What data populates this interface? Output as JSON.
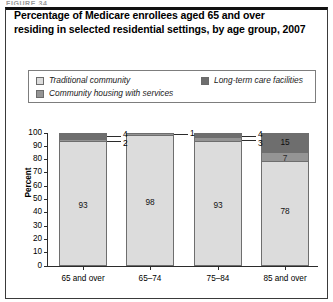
{
  "figure": {
    "stub_text": "FIGURE 34",
    "title": "Percentage of Medicare enrollees aged 65 and over residing in selected residential settings, by age group, 2007"
  },
  "legend": {
    "items": [
      {
        "label": "Traditional community",
        "color": "#dcdcdc",
        "name": "traditional-community"
      },
      {
        "label": "Community housing with services",
        "color": "#949494",
        "name": "community-housing-with-services"
      },
      {
        "label": "Long-term care facilities",
        "color": "#6e6e6e",
        "name": "long-term-care-facilities"
      }
    ]
  },
  "chart_data": {
    "type": "bar",
    "subtype": "stacked-column",
    "title": "Percentage of Medicare enrollees aged 65 and over residing in selected residential settings, by age group, 2007",
    "xlabel": "",
    "ylabel": "Percent",
    "ylim": [
      0,
      100
    ],
    "yticks": [
      0,
      10,
      20,
      30,
      40,
      50,
      60,
      70,
      80,
      90,
      100
    ],
    "grid": false,
    "legend_position": "top",
    "categories": [
      "65 and over",
      "65–74",
      "75–84",
      "85 and over"
    ],
    "series": [
      {
        "name": "Traditional community",
        "color": "#dcdcdc",
        "values": [
          93,
          98,
          93,
          78
        ]
      },
      {
        "name": "Community housing with services",
        "color": "#949494",
        "values": [
          2,
          1,
          3,
          7
        ]
      },
      {
        "name": "Long-term care facilities",
        "color": "#6e6e6e",
        "values": [
          4,
          1,
          4,
          15
        ]
      }
    ],
    "labels": {
      "65 and over": {
        "traditional": "93",
        "housing": "2",
        "ltc": "4"
      },
      "65–74": {
        "traditional": "98",
        "housing": "",
        "ltc": "1"
      },
      "75–84": {
        "traditional": "93",
        "housing": "3",
        "ltc": "4"
      },
      "85 and over": {
        "traditional": "78",
        "housing": "7",
        "ltc": "15"
      }
    },
    "callouts": [
      {
        "group": "65 and over",
        "label": "4",
        "series": "Long-term care facilities"
      },
      {
        "group": "65 and over",
        "label": "2",
        "series": "Community housing with services"
      },
      {
        "group": "65–74",
        "label": "1",
        "series": "Long-term care facilities"
      },
      {
        "group": "75–84",
        "label": "4",
        "series": "Long-term care facilities"
      },
      {
        "group": "75–84",
        "label": "3",
        "series": "Community housing with services"
      }
    ]
  }
}
